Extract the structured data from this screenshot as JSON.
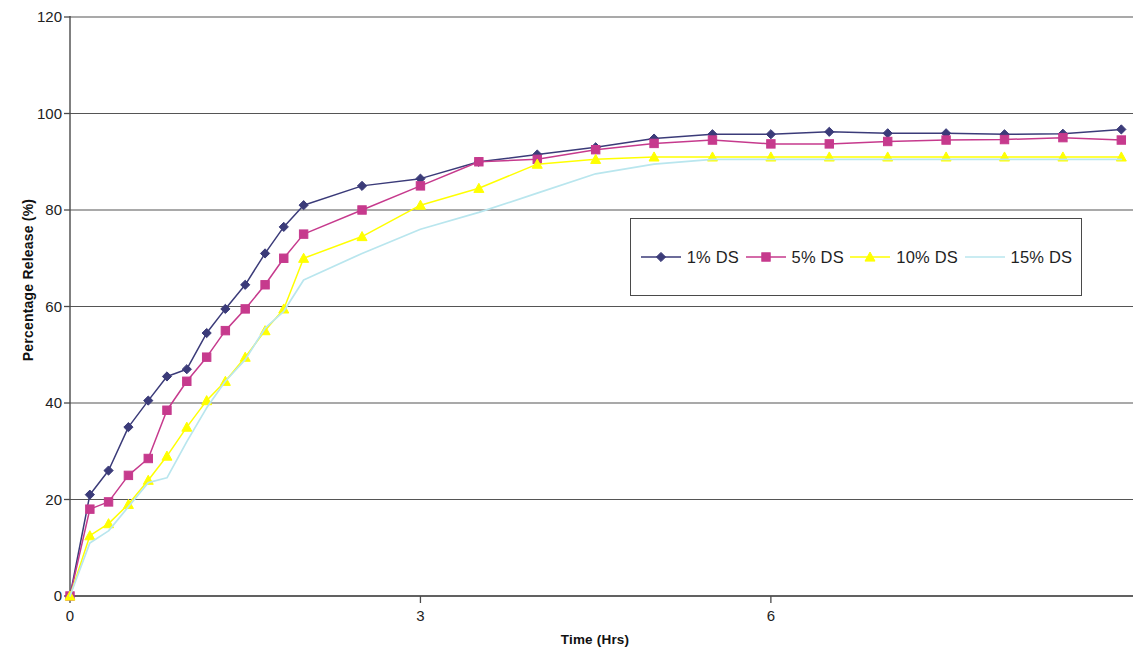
{
  "chart_data": {
    "type": "line",
    "title": "",
    "xlabel": "Time (Hrs)",
    "ylabel": "Percentage Release (%)",
    "xlim": [
      0,
      9.1
    ],
    "ylim": [
      0,
      120
    ],
    "y_ticks": [
      0,
      20,
      40,
      60,
      80,
      100,
      120
    ],
    "x_ticks": [
      0,
      3,
      6
    ],
    "grid": "horizontal",
    "legend_position": "inside-right-middle",
    "x": [
      0,
      0.17,
      0.33,
      0.5,
      0.67,
      0.83,
      1.0,
      1.17,
      1.33,
      1.5,
      1.67,
      1.83,
      2.0,
      2.5,
      3.0,
      3.5,
      4.0,
      4.5,
      5.0,
      5.5,
      6.0,
      6.5,
      7.0,
      7.5,
      8.0,
      8.5,
      9.0
    ],
    "series": [
      {
        "name": "1% DS",
        "color": "#3b3b79",
        "marker": "diamond",
        "values": [
          0,
          21,
          26,
          35,
          40.5,
          45.5,
          47,
          54.5,
          59.5,
          64.5,
          71,
          76.5,
          81,
          85,
          86.5,
          90,
          91.5,
          93,
          94.8,
          95.7,
          95.7,
          96.2,
          95.9,
          95.9,
          95.7,
          95.8,
          96.7
        ]
      },
      {
        "name": "5% DS",
        "color": "#c63a8d",
        "marker": "square",
        "values": [
          0,
          18,
          19.5,
          25,
          28.5,
          38.5,
          44.5,
          49.5,
          55,
          59.5,
          64.5,
          70,
          75,
          80,
          85,
          90,
          90.5,
          92.5,
          93.8,
          94.5,
          93.7,
          93.7,
          94.2,
          94.5,
          94.6,
          95,
          94.5
        ]
      },
      {
        "name": "10% DS",
        "color": "#ffff00",
        "marker": "triangle",
        "values": [
          0,
          12.5,
          15,
          19,
          24,
          29,
          35,
          40.5,
          44.5,
          49.5,
          55,
          59.5,
          70,
          74.5,
          81,
          84.5,
          89.5,
          90.5,
          91,
          91,
          91,
          91,
          91,
          91,
          91,
          91,
          91
        ]
      },
      {
        "name": "15% DS",
        "color": "#b9e6ee",
        "marker": "none",
        "values": [
          0,
          11,
          13.5,
          18.5,
          23.5,
          24.5,
          32,
          39,
          44.5,
          49,
          55.5,
          59,
          65.5,
          71,
          76,
          79.5,
          83.5,
          87.5,
          89.5,
          90.5,
          90.5,
          90.5,
          90.5,
          90.5,
          90.5,
          90.5,
          90.5
        ]
      }
    ],
    "legend": [
      {
        "label": "1% DS",
        "color": "#3b3b79",
        "marker": "diamond"
      },
      {
        "label": "5% DS",
        "color": "#c63a8d",
        "marker": "square"
      },
      {
        "label": "10% DS",
        "color": "#ffff00",
        "marker": "triangle"
      },
      {
        "label": "15% DS",
        "color": "#b9e6ee",
        "marker": "none"
      }
    ]
  },
  "axes": {
    "y_title": "Percentage Release (%)",
    "x_title": "Time (Hrs)",
    "y_tick_labels": [
      "0",
      "20",
      "40",
      "60",
      "80",
      "100",
      "120"
    ],
    "x_tick_labels": [
      "0",
      "3",
      "6"
    ]
  },
  "colors": {
    "axis": "#4a4a4a",
    "grid": "#555555",
    "background": "#ffffff",
    "text": "#1a1a1a"
  }
}
